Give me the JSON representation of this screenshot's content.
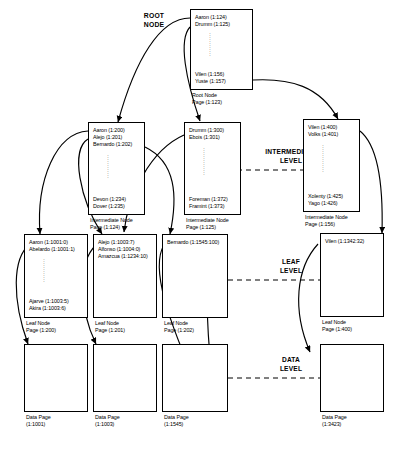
{
  "labels": {
    "root": "ROOT\nNODE",
    "root_line1": "ROOT",
    "root_line2": "NODE",
    "intermediate_line1": "INTERMEDIATE",
    "intermediate_line2": "LEVEL",
    "leaf_line1": "LEAF",
    "leaf_line2": "LEVEL",
    "data_line1": "DATA",
    "data_line2": "LEVEL"
  },
  "root_node": {
    "top_entries": [
      "Aaron (1:124)",
      "Drumm (1:125)"
    ],
    "bottom_entries": [
      "Vilen (1:156)",
      "Yuste (1:157)"
    ],
    "caption_line1": "Root Node",
    "caption_line2": "Page (1:123)"
  },
  "intermediate_nodes": [
    {
      "top_entries": [
        "Aaron (1:200)",
        "Alejo (1:201)",
        "Bernardo (1:202)"
      ],
      "bottom_entries": [
        "Devon (1:234)",
        "Dover (1:235)"
      ],
      "caption_line1": "Intermediate Node",
      "caption_line2": "Page (1:124)"
    },
    {
      "top_entries": [
        "Drumm (1:300)",
        "Ebois (1:301)"
      ],
      "bottom_entries": [
        "Foreman (1:372)",
        "Framint (1:373)"
      ],
      "caption_line1": "Intermediate Node",
      "caption_line2": "Page (1:125)"
    },
    {
      "top_entries": [
        "Vilen (1:400)",
        "Volks (1:401)"
      ],
      "bottom_entries": [
        "Xolenty (1:425)",
        "Yago (1:426)"
      ],
      "caption_line1": "Intermediate Node",
      "caption_line2": "Page (1:156)"
    }
  ],
  "leaf_nodes": [
    {
      "top_entries": [
        "Aaron (1:1001:0)",
        "Abelardo (1:1001:1)"
      ],
      "bottom_entries": [
        "Ajarve (1:1003:5)",
        "Akira (1:1003:6)"
      ],
      "caption_line1": "Leaf Node",
      "caption_line2": "Page (1:200)"
    },
    {
      "top_entries": [
        "Alejo (1:1003:7)",
        "Alfonso (1:1004:0)",
        "Amazcua (1:1234:10)"
      ],
      "bottom_entries": [],
      "caption_line1": "Leaf Node",
      "caption_line2": "Page (1:201)"
    },
    {
      "top_entries": [
        "Bernardo (1:1545:100)"
      ],
      "bottom_entries": [],
      "caption_line1": "Leaf Node",
      "caption_line2": "Page (1:202)"
    },
    {
      "top_entries": [
        "Vilen (1:1342:32)"
      ],
      "bottom_entries": [],
      "caption_line1": "Leaf Node",
      "caption_line2": "Page (1:400)"
    }
  ],
  "data_pages": [
    {
      "caption_line1": "Data Page",
      "caption_line2": "(1:1001)"
    },
    {
      "caption_line1": "Data Page",
      "caption_line2": "(1:1003)"
    },
    {
      "caption_line1": "Data Page",
      "caption_line2": "(1:1545)"
    },
    {
      "caption_line1": "Data Page",
      "caption_line2": "(1:3423)"
    }
  ],
  "colors": {
    "ink": "#000000",
    "paper": "#ffffff"
  }
}
